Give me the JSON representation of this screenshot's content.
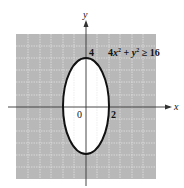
{
  "figure": {
    "inequality": "4x² + y² ≥ 16",
    "inequality_parts": {
      "a": "4",
      "x": "x",
      "sup1": "2",
      "plus": " + ",
      "y": "y",
      "sup2": "2",
      "rel": " ≥ 16"
    },
    "axes": {
      "x_label": "x",
      "y_label": "y"
    },
    "ticks": {
      "origin": "0",
      "x_tick": "2",
      "y_tick": "4"
    },
    "colors": {
      "shade": "#b8b8b8",
      "grid": "#e6e6e6",
      "curve": "#111111",
      "interior": "#ffffff",
      "axis": "#333333"
    }
  }
}
